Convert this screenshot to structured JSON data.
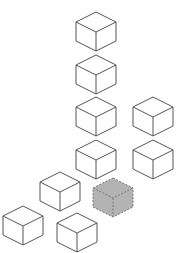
{
  "diagram": {
    "cube_size": {
      "half_width": 20,
      "top_half_height": 10,
      "side_height": 19
    },
    "colors": {
      "stroke": "#555555",
      "fill": "#ffffff",
      "highlight_fill": "#b3b3b3",
      "highlight_stroke": "#777777"
    },
    "cubes": [
      {
        "id": "cube-1",
        "x": 96,
        "y": 12,
        "highlighted": false
      },
      {
        "id": "cube-2",
        "x": 96,
        "y": 55,
        "highlighted": false
      },
      {
        "id": "cube-3",
        "x": 96,
        "y": 97,
        "highlighted": false
      },
      {
        "id": "cube-4",
        "x": 153,
        "y": 97,
        "highlighted": false
      },
      {
        "id": "cube-5",
        "x": 96,
        "y": 140,
        "highlighted": false
      },
      {
        "id": "cube-6",
        "x": 153,
        "y": 140,
        "highlighted": false
      },
      {
        "id": "cube-7",
        "x": 60,
        "y": 172,
        "highlighted": false
      },
      {
        "id": "cube-highlighted",
        "x": 113,
        "y": 178,
        "highlighted": true
      },
      {
        "id": "cube-8",
        "x": 23,
        "y": 206,
        "highlighted": false
      },
      {
        "id": "cube-9",
        "x": 77,
        "y": 213,
        "highlighted": false
      }
    ]
  }
}
